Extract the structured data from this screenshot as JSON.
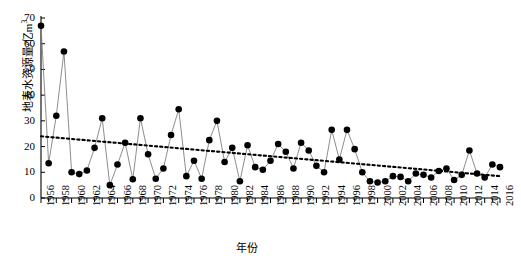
{
  "chart_data": {
    "type": "line",
    "title": "",
    "xlabel": "年份",
    "ylabel": "地表水资源量/亿m³",
    "ylabel_main": "地表水资源量/亿m",
    "ylabel_sup": "3",
    "xlim": [
      1956,
      2016
    ],
    "ylim": [
      0,
      70
    ],
    "ytick_step": 10,
    "xtick_step": 1,
    "xtick_label_step": 2,
    "grid": false,
    "legend": null,
    "marker": "filled-circle",
    "marker_color": "#000000",
    "line_color": "#808080",
    "trend_color": "#000000",
    "trend_style": "dotted",
    "yticks": [
      0,
      10,
      20,
      30,
      40,
      50,
      60,
      70
    ],
    "xticks": [
      1956,
      1958,
      1960,
      1962,
      1964,
      1966,
      1968,
      1970,
      1972,
      1974,
      1976,
      1978,
      1980,
      1982,
      1984,
      1986,
      1988,
      1990,
      1992,
      1994,
      1996,
      1998,
      2000,
      2002,
      2004,
      2006,
      2008,
      2010,
      2012,
      2014,
      2016
    ],
    "x": [
      1956,
      1957,
      1958,
      1959,
      1960,
      1961,
      1962,
      1963,
      1964,
      1965,
      1966,
      1967,
      1968,
      1969,
      1970,
      1971,
      1972,
      1973,
      1974,
      1975,
      1976,
      1977,
      1978,
      1979,
      1980,
      1981,
      1982,
      1983,
      1984,
      1985,
      1986,
      1987,
      1988,
      1989,
      1990,
      1991,
      1992,
      1993,
      1994,
      1995,
      1996,
      1997,
      1998,
      1999,
      2000,
      2001,
      2002,
      2003,
      2004,
      2005,
      2006,
      2007,
      2008,
      2009,
      2010,
      2011,
      2012,
      2013,
      2014,
      2015,
      2016
    ],
    "values": [
      67.0,
      13.5,
      32.0,
      57.0,
      10.0,
      9.3,
      10.7,
      19.5,
      31.0,
      5.0,
      13.0,
      21.5,
      7.3,
      31.0,
      17.0,
      7.5,
      11.5,
      24.5,
      34.5,
      8.5,
      14.5,
      7.5,
      22.5,
      30.0,
      14.0,
      19.5,
      6.5,
      20.5,
      12.0,
      11.0,
      14.5,
      21.0,
      18.0,
      11.5,
      21.5,
      18.5,
      12.5,
      10.0,
      26.5,
      15.0,
      26.5,
      19.0,
      10.0,
      6.5,
      6.0,
      6.5,
      8.5,
      8.2,
      6.5,
      9.5,
      9.0,
      8.0,
      10.5,
      11.5,
      7.0,
      9.0,
      18.5,
      9.5,
      8.0,
      13.0,
      12.0
    ],
    "trend": {
      "x_start": 1956,
      "y_start": 24.0,
      "x_end": 2016,
      "y_end": 8.5,
      "note": "linear declining dotted trend line"
    }
  }
}
